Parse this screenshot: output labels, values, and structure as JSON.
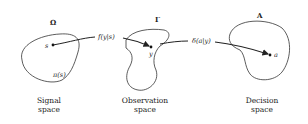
{
  "spaces": [
    {
      "symbol": "Ω",
      "caption_line1": "Signal",
      "caption_line2": "space",
      "point_label": "s",
      "density_label": "π(s)"
    },
    {
      "symbol": "Γ",
      "caption_line1": "Observation",
      "caption_line2": "space",
      "point_label": "y"
    },
    {
      "symbol": "A",
      "caption_line1": "Decision",
      "caption_line2": "space",
      "point_label": "a"
    }
  ],
  "mappings": [
    {
      "label": "f(y|s)",
      "from": "s",
      "to": "y"
    },
    {
      "label": "δ(a|y)",
      "from": "y",
      "to": "a"
    }
  ],
  "colors": {
    "stroke": "#222222",
    "background": "#ffffff"
  }
}
